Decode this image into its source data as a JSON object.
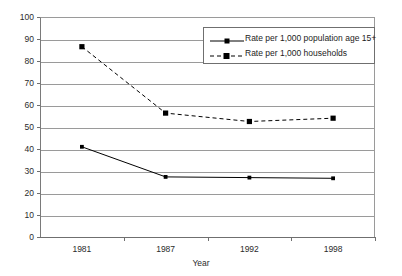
{
  "chart_data": {
    "type": "line",
    "title": "",
    "xlabel": "Year",
    "ylabel": "Rate",
    "categories": [
      "1981",
      "1987",
      "1992",
      "1998"
    ],
    "ylim": [
      0,
      100
    ],
    "ytick_step": 10,
    "yticks": [
      "100",
      "90",
      "80",
      "70",
      "60",
      "50",
      "40",
      "30",
      "20",
      "10",
      "0"
    ],
    "grid": true,
    "legend_position": "upper-right-inside",
    "series": [
      {
        "name": "Rate per 1,000 population age 15+",
        "style": "solid",
        "marker": "diamond",
        "color": "#000000",
        "values": [
          41,
          27.3,
          27,
          26.7
        ]
      },
      {
        "name": "Rate per 1,000 households",
        "style": "dashed",
        "marker": "square",
        "color": "#000000",
        "values": [
          86.5,
          56.3,
          52.5,
          54
        ]
      }
    ]
  },
  "legend": {
    "items": [
      {
        "label": "Rate per 1,000 population age 15+"
      },
      {
        "label": "Rate per 1,000 households"
      }
    ]
  }
}
